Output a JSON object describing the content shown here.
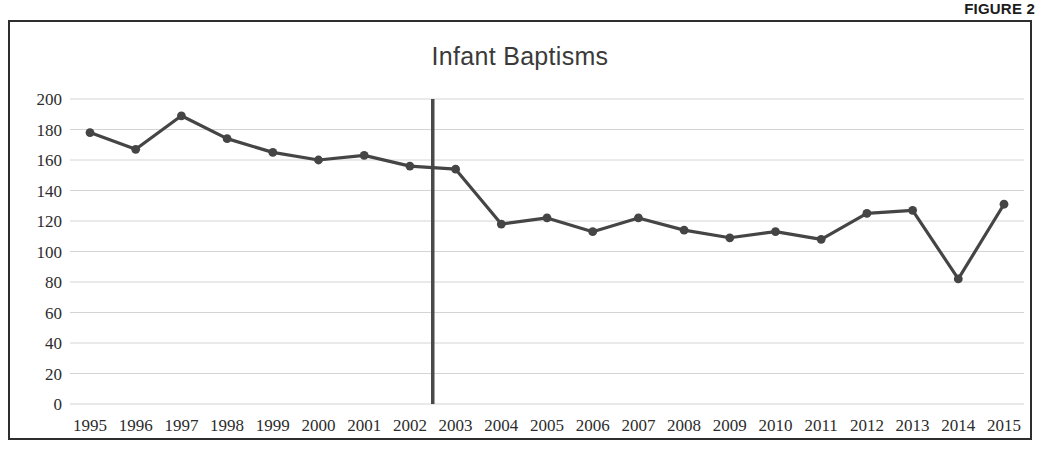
{
  "figure": {
    "label": "FIGURE 2"
  },
  "chart_data": {
    "type": "line",
    "title": "Infant Baptisms",
    "xlabel": "",
    "ylabel": "",
    "ylim": [
      0,
      200
    ],
    "ytick_step": 20,
    "yticks": [
      "200",
      "180",
      "160",
      "140",
      "120",
      "100",
      "80",
      "60",
      "40",
      "20",
      "0"
    ],
    "grid": true,
    "legend": "none",
    "categories": [
      "1995",
      "1996",
      "1997",
      "1998",
      "1999",
      "2000",
      "2001",
      "2002",
      "2003",
      "2004",
      "2005",
      "2006",
      "2007",
      "2008",
      "2009",
      "2010",
      "2011",
      "2012",
      "2013",
      "2014",
      "2015"
    ],
    "values": [
      178,
      167,
      189,
      174,
      165,
      160,
      163,
      156,
      154,
      118,
      122,
      113,
      122,
      114,
      109,
      113,
      108,
      125,
      127,
      82,
      131
    ],
    "series": [
      {
        "name": "Infant Baptisms",
        "values": [
          178,
          167,
          189,
          174,
          165,
          160,
          163,
          156,
          154,
          118,
          122,
          113,
          122,
          114,
          109,
          113,
          108,
          125,
          127,
          82,
          131
        ]
      }
    ],
    "annotations": [
      {
        "type": "vertical-divider",
        "between": [
          "2002",
          "2003"
        ],
        "x_position": 7.5,
        "y_from": 0,
        "y_to": 200
      }
    ],
    "colors": {
      "line": "#454545",
      "marker": "#454545",
      "gridline": "#d4d4d4",
      "divider": "#4a4a4a",
      "title": "#3a3a3a",
      "frame": "#2e2e2e",
      "tick_label": "#2c2c2c"
    }
  }
}
